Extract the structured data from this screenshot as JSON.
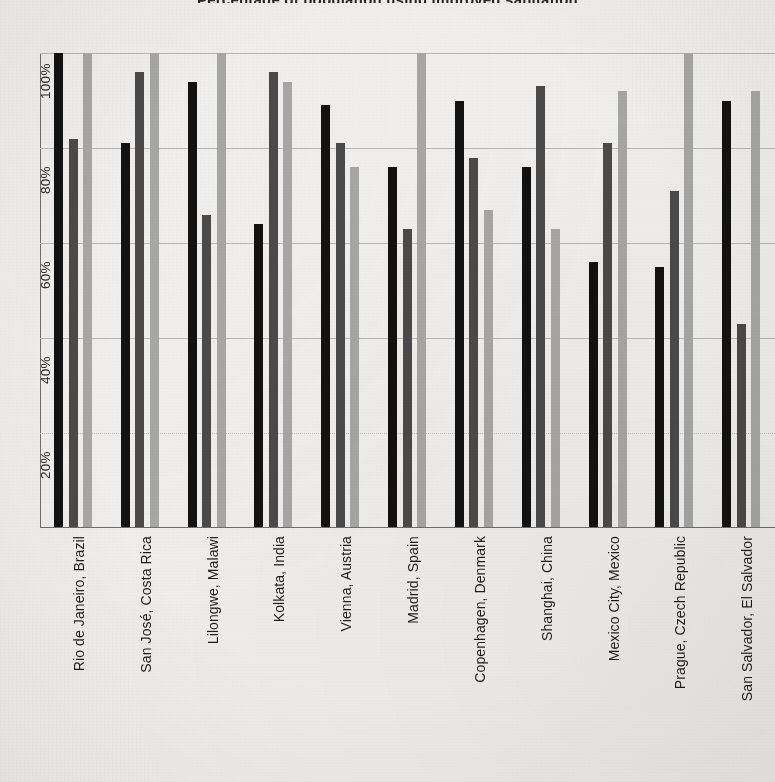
{
  "chart_data": {
    "type": "bar",
    "title": "Percentage of population using improved sanitation",
    "xlabel": "",
    "ylabel": "",
    "ylim": [
      0,
      105
    ],
    "grid": true,
    "legend_position": "none",
    "axis_tick_labels": [
      "20%",
      "40%",
      "60%",
      "80%",
      "100%"
    ],
    "axis_tick_values": [
      20,
      40,
      60,
      80,
      100
    ],
    "categories": [
      "Rio de Janeiro, Brazil",
      "San José, Costa Rica",
      "Lilongwe, Malawi",
      "Kolkata, India",
      "Vienna, Austria",
      "Madrid, Spain",
      "Copenhagen, Denmark",
      "Shanghai, China",
      "Mexico City, Mexico",
      "Prague, Czech Republic",
      "San Salvador, El Salvador"
    ],
    "series": [
      {
        "name": "Series 1",
        "color": "#121212",
        "values": [
          100,
          81,
          94,
          64,
          89,
          76,
          90,
          76,
          56,
          55,
          90
        ]
      },
      {
        "name": "Series 2",
        "color": "#4a4a4a",
        "values": [
          82,
          96,
          66,
          96,
          81,
          63,
          78,
          93,
          81,
          71,
          43
        ]
      },
      {
        "name": "Series 3",
        "color": "#a6a6a4",
        "values": [
          100,
          100,
          100,
          94,
          76,
          100,
          67,
          63,
          92,
          100,
          92
        ]
      }
    ]
  },
  "colors": {
    "background": "#efeeec",
    "axis": "#6f6e6b",
    "gridline": "#b9b8b4",
    "series_1": "#121212",
    "series_2": "#4a4a4a",
    "series_3": "#a6a6a4",
    "text": "#1b1b1b"
  }
}
